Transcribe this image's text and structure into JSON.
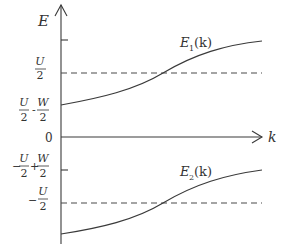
{
  "diagram": {
    "type": "energy-band-diagram",
    "axes": {
      "y_label": "E",
      "x_label": "k",
      "origin_label": "0"
    },
    "curves": [
      {
        "name": "E1",
        "label_main": "E",
        "label_sub": "1",
        "label_arg": "(k)"
      },
      {
        "name": "E2",
        "label_main": "E",
        "label_sub": "2",
        "label_arg": "(k)"
      }
    ],
    "y_ticks": [
      {
        "id": "u2",
        "text": "U/2",
        "num": "U",
        "den": "2",
        "sign": ""
      },
      {
        "id": "u2_minus_w2",
        "text": "U/2 - W/2",
        "num1": "U",
        "den1": "2",
        "op": "-",
        "num2": "W",
        "den2": "2",
        "sign": ""
      },
      {
        "id": "neg_u2_plus_w2",
        "text": "-U/2 + W/2",
        "num1": "U",
        "den1": "2",
        "op": "+",
        "num2": "W",
        "den2": "2",
        "sign": "−"
      },
      {
        "id": "neg_u2",
        "text": "-U/2",
        "num": "U",
        "den": "2",
        "sign": "−"
      }
    ],
    "dashed_levels": [
      "U/2",
      "-U/2"
    ]
  }
}
